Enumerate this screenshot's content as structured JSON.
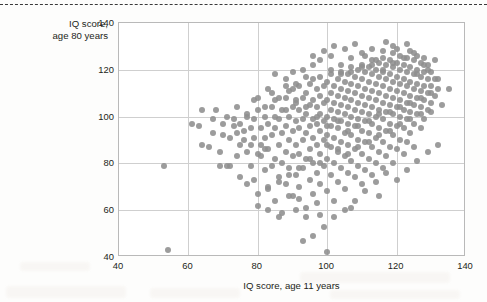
{
  "page": {
    "top_rule": "dashed",
    "background": "#fdfdfc"
  },
  "chart_data": {
    "type": "scatter",
    "title": "",
    "xlabel": "IQ score, age 11 years",
    "ylabel": "IQ score,\nage 80 years",
    "ylabel_line1": "IQ score,",
    "ylabel_line2": "age 80 years",
    "xlim": [
      40,
      140
    ],
    "ylim": [
      40,
      140
    ],
    "xticks": [
      40,
      60,
      80,
      100,
      120,
      140
    ],
    "yticks": [
      40,
      60,
      80,
      100,
      120,
      140
    ],
    "grid": true,
    "legend": null,
    "marker_color": "#8e8e8e",
    "marker_size_px": 6,
    "n_points": 424,
    "points": [
      [
        53,
        79
      ],
      [
        54,
        43
      ],
      [
        63,
        96
      ],
      [
        64,
        88
      ],
      [
        66,
        87
      ],
      [
        67,
        93
      ],
      [
        69,
        85
      ],
      [
        70,
        97
      ],
      [
        71,
        79
      ],
      [
        72,
        79
      ],
      [
        73,
        96
      ],
      [
        74,
        93
      ],
      [
        75,
        97
      ],
      [
        75,
        74
      ],
      [
        76,
        90
      ],
      [
        77,
        101
      ],
      [
        77,
        85
      ],
      [
        78,
        88
      ],
      [
        78,
        95
      ],
      [
        79,
        73
      ],
      [
        79,
        99
      ],
      [
        80,
        62
      ],
      [
        80,
        84
      ],
      [
        80,
        103
      ],
      [
        81,
        88
      ],
      [
        81,
        95
      ],
      [
        82,
        77
      ],
      [
        82,
        91
      ],
      [
        82,
        100
      ],
      [
        83,
        69
      ],
      [
        83,
        86
      ],
      [
        83,
        97
      ],
      [
        84,
        79
      ],
      [
        84,
        92
      ],
      [
        84,
        104
      ],
      [
        85,
        64
      ],
      [
        85,
        82
      ],
      [
        85,
        95
      ],
      [
        85,
        107
      ],
      [
        86,
        74
      ],
      [
        86,
        88
      ],
      [
        86,
        99
      ],
      [
        87,
        80
      ],
      [
        87,
        93
      ],
      [
        87,
        103
      ],
      [
        88,
        71
      ],
      [
        88,
        85
      ],
      [
        88,
        96
      ],
      [
        88,
        108
      ],
      [
        89,
        78
      ],
      [
        89,
        90
      ],
      [
        89,
        100
      ],
      [
        89,
        111
      ],
      [
        90,
        66
      ],
      [
        90,
        83
      ],
      [
        90,
        94
      ],
      [
        90,
        104
      ],
      [
        90,
        112
      ],
      [
        91,
        75
      ],
      [
        91,
        88
      ],
      [
        91,
        98
      ],
      [
        91,
        107
      ],
      [
        92,
        70
      ],
      [
        92,
        84
      ],
      [
        92,
        95
      ],
      [
        92,
        103
      ],
      [
        92,
        113
      ],
      [
        93,
        78
      ],
      [
        93,
        90
      ],
      [
        93,
        99
      ],
      [
        93,
        108
      ],
      [
        94,
        61
      ],
      [
        94,
        82
      ],
      [
        94,
        93
      ],
      [
        94,
        101
      ],
      [
        94,
        110
      ],
      [
        95,
        73
      ],
      [
        95,
        86
      ],
      [
        95,
        96
      ],
      [
        95,
        105
      ],
      [
        95,
        114
      ],
      [
        96,
        67
      ],
      [
        96,
        80
      ],
      [
        96,
        91
      ],
      [
        96,
        99
      ],
      [
        96,
        107
      ],
      [
        96,
        116
      ],
      [
        97,
        76
      ],
      [
        97,
        88
      ],
      [
        97,
        97
      ],
      [
        97,
        104
      ],
      [
        97,
        112
      ],
      [
        98,
        58
      ],
      [
        98,
        71
      ],
      [
        98,
        84
      ],
      [
        98,
        94
      ],
      [
        98,
        101
      ],
      [
        98,
        109
      ],
      [
        98,
        117
      ],
      [
        99,
        79
      ],
      [
        99,
        90
      ],
      [
        99,
        98
      ],
      [
        99,
        106
      ],
      [
        99,
        113
      ],
      [
        100,
        42
      ],
      [
        100,
        68
      ],
      [
        100,
        82
      ],
      [
        100,
        92
      ],
      [
        100,
        100
      ],
      [
        100,
        107
      ],
      [
        100,
        115
      ],
      [
        101,
        75
      ],
      [
        101,
        87
      ],
      [
        101,
        96
      ],
      [
        101,
        103
      ],
      [
        101,
        110
      ],
      [
        101,
        118
      ],
      [
        102,
        64
      ],
      [
        102,
        80
      ],
      [
        102,
        91
      ],
      [
        102,
        99
      ],
      [
        102,
        106
      ],
      [
        102,
        113
      ],
      [
        103,
        72
      ],
      [
        103,
        85
      ],
      [
        103,
        95
      ],
      [
        103,
        102
      ],
      [
        103,
        109
      ],
      [
        103,
        116
      ],
      [
        104,
        78
      ],
      [
        104,
        89
      ],
      [
        104,
        98
      ],
      [
        104,
        105
      ],
      [
        104,
        112
      ],
      [
        104,
        119
      ],
      [
        105,
        69
      ],
      [
        105,
        83
      ],
      [
        105,
        93
      ],
      [
        105,
        101
      ],
      [
        105,
        108
      ],
      [
        105,
        115
      ],
      [
        106,
        76
      ],
      [
        106,
        88
      ],
      [
        106,
        97
      ],
      [
        106,
        104
      ],
      [
        106,
        111
      ],
      [
        106,
        118
      ],
      [
        107,
        61
      ],
      [
        107,
        81
      ],
      [
        107,
        92
      ],
      [
        107,
        100
      ],
      [
        107,
        107
      ],
      [
        107,
        114
      ],
      [
        107,
        121
      ],
      [
        108,
        74
      ],
      [
        108,
        86
      ],
      [
        108,
        96
      ],
      [
        108,
        103
      ],
      [
        108,
        110
      ],
      [
        108,
        117
      ],
      [
        109,
        79
      ],
      [
        109,
        90
      ],
      [
        109,
        99
      ],
      [
        109,
        106
      ],
      [
        109,
        113
      ],
      [
        109,
        120
      ],
      [
        110,
        71
      ],
      [
        110,
        84
      ],
      [
        110,
        94
      ],
      [
        110,
        102
      ],
      [
        110,
        109
      ],
      [
        110,
        116
      ],
      [
        110,
        122
      ],
      [
        111,
        77
      ],
      [
        111,
        89
      ],
      [
        111,
        98
      ],
      [
        111,
        105
      ],
      [
        111,
        112
      ],
      [
        111,
        119
      ],
      [
        112,
        82
      ],
      [
        112,
        93
      ],
      [
        112,
        101
      ],
      [
        112,
        108
      ],
      [
        112,
        115
      ],
      [
        112,
        121
      ],
      [
        113,
        75
      ],
      [
        113,
        87
      ],
      [
        113,
        97
      ],
      [
        113,
        104
      ],
      [
        113,
        111
      ],
      [
        113,
        118
      ],
      [
        113,
        124
      ],
      [
        114,
        80
      ],
      [
        114,
        91
      ],
      [
        114,
        100
      ],
      [
        114,
        107
      ],
      [
        114,
        114
      ],
      [
        114,
        120
      ],
      [
        115,
        66
      ],
      [
        115,
        85
      ],
      [
        115,
        95
      ],
      [
        115,
        103
      ],
      [
        115,
        110
      ],
      [
        115,
        117
      ],
      [
        115,
        123
      ],
      [
        116,
        78
      ],
      [
        116,
        89
      ],
      [
        116,
        99
      ],
      [
        116,
        106
      ],
      [
        116,
        113
      ],
      [
        116,
        119
      ],
      [
        116,
        125
      ],
      [
        117,
        83
      ],
      [
        117,
        94
      ],
      [
        117,
        102
      ],
      [
        117,
        109
      ],
      [
        117,
        116
      ],
      [
        117,
        122
      ],
      [
        118,
        87
      ],
      [
        118,
        97
      ],
      [
        118,
        105
      ],
      [
        118,
        112
      ],
      [
        118,
        118
      ],
      [
        118,
        124
      ],
      [
        119,
        80
      ],
      [
        119,
        92
      ],
      [
        119,
        101
      ],
      [
        119,
        108
      ],
      [
        119,
        115
      ],
      [
        119,
        121
      ],
      [
        119,
        127
      ],
      [
        120,
        86
      ],
      [
        120,
        96
      ],
      [
        120,
        104
      ],
      [
        120,
        111
      ],
      [
        120,
        117
      ],
      [
        120,
        123
      ],
      [
        121,
        90
      ],
      [
        121,
        100
      ],
      [
        121,
        107
      ],
      [
        121,
        114
      ],
      [
        121,
        120
      ],
      [
        121,
        126
      ],
      [
        122,
        84
      ],
      [
        122,
        95
      ],
      [
        122,
        103
      ],
      [
        122,
        110
      ],
      [
        122,
        116
      ],
      [
        122,
        122
      ],
      [
        123,
        89
      ],
      [
        123,
        99
      ],
      [
        123,
        106
      ],
      [
        123,
        113
      ],
      [
        123,
        119
      ],
      [
        123,
        125
      ],
      [
        124,
        93
      ],
      [
        124,
        102
      ],
      [
        124,
        109
      ],
      [
        124,
        115
      ],
      [
        124,
        121
      ],
      [
        124,
        128
      ],
      [
        125,
        87
      ],
      [
        125,
        97
      ],
      [
        125,
        105
      ],
      [
        125,
        112
      ],
      [
        125,
        118
      ],
      [
        125,
        124
      ],
      [
        126,
        101
      ],
      [
        126,
        108
      ],
      [
        126,
        114
      ],
      [
        126,
        120
      ],
      [
        126,
        126
      ],
      [
        127,
        95
      ],
      [
        127,
        104
      ],
      [
        127,
        111
      ],
      [
        127,
        117
      ],
      [
        127,
        123
      ],
      [
        128,
        99
      ],
      [
        128,
        107
      ],
      [
        128,
        113
      ],
      [
        128,
        119
      ],
      [
        128,
        125
      ],
      [
        129,
        103
      ],
      [
        129,
        110
      ],
      [
        129,
        116
      ],
      [
        129,
        122
      ],
      [
        130,
        106
      ],
      [
        130,
        113
      ],
      [
        130,
        119
      ],
      [
        131,
        109
      ],
      [
        131,
        116
      ],
      [
        132,
        112
      ],
      [
        86,
        108
      ],
      [
        90,
        119
      ],
      [
        93,
        120
      ],
      [
        96,
        122
      ],
      [
        88,
        113
      ],
      [
        84,
        110
      ],
      [
        87,
        59
      ],
      [
        91,
        60
      ],
      [
        94,
        57
      ],
      [
        97,
        63
      ],
      [
        89,
        66
      ],
      [
        92,
        65
      ],
      [
        83,
        60
      ],
      [
        86,
        57
      ],
      [
        78,
        79
      ],
      [
        81,
        83
      ],
      [
        75,
        88
      ],
      [
        72,
        91
      ],
      [
        69,
        79
      ],
      [
        74,
        83
      ],
      [
        79,
        91
      ],
      [
        82,
        86
      ],
      [
        85,
        100
      ],
      [
        88,
        103
      ],
      [
        91,
        106
      ],
      [
        94,
        104
      ],
      [
        97,
        100
      ],
      [
        100,
        96
      ],
      [
        103,
        98
      ],
      [
        106,
        94
      ],
      [
        109,
        96
      ],
      [
        112,
        98
      ],
      [
        115,
        101
      ],
      [
        118,
        102
      ],
      [
        121,
        104
      ],
      [
        124,
        106
      ],
      [
        127,
        108
      ],
      [
        130,
        110
      ],
      [
        98,
        124
      ],
      [
        101,
        126
      ],
      [
        104,
        122
      ],
      [
        107,
        125
      ],
      [
        110,
        127
      ],
      [
        113,
        129
      ],
      [
        116,
        128
      ],
      [
        119,
        130
      ],
      [
        105,
        60
      ],
      [
        108,
        64
      ],
      [
        111,
        68
      ],
      [
        102,
        57
      ],
      [
        99,
        53
      ],
      [
        96,
        49
      ],
      [
        93,
        47
      ],
      [
        114,
        72
      ],
      [
        117,
        76
      ],
      [
        120,
        73
      ],
      [
        123,
        77
      ],
      [
        126,
        81
      ],
      [
        129,
        85
      ],
      [
        132,
        88
      ],
      [
        80,
        108
      ],
      [
        83,
        112
      ],
      [
        77,
        100
      ],
      [
        74,
        104
      ],
      [
        71,
        100
      ],
      [
        68,
        103
      ],
      [
        100,
        88
      ],
      [
        103,
        86
      ],
      [
        106,
        84
      ],
      [
        109,
        87
      ],
      [
        112,
        89
      ],
      [
        115,
        92
      ],
      [
        118,
        94
      ],
      [
        121,
        97
      ],
      [
        124,
        99
      ],
      [
        127,
        101
      ],
      [
        95,
        82
      ],
      [
        98,
        80
      ],
      [
        92,
        78
      ],
      [
        89,
        75
      ],
      [
        86,
        72
      ],
      [
        83,
        70
      ],
      [
        80,
        67
      ],
      [
        77,
        71
      ],
      [
        101,
        120
      ],
      [
        104,
        118
      ],
      [
        107,
        119
      ],
      [
        110,
        121
      ],
      [
        113,
        122
      ],
      [
        116,
        120
      ],
      [
        119,
        123
      ],
      [
        122,
        125
      ],
      [
        125,
        127
      ],
      [
        128,
        122
      ],
      [
        131,
        124
      ],
      [
        94,
        117
      ],
      [
        91,
        114
      ],
      [
        88,
        116
      ],
      [
        85,
        118
      ],
      [
        82,
        104
      ],
      [
        79,
        107
      ],
      [
        76,
        94
      ],
      [
        73,
        99
      ],
      [
        70,
        92
      ],
      [
        67,
        99
      ],
      [
        64,
        103
      ],
      [
        61,
        97
      ],
      [
        105,
        129
      ],
      [
        108,
        131
      ],
      [
        111,
        126
      ],
      [
        99,
        128
      ],
      [
        96,
        126
      ],
      [
        102,
        130
      ],
      [
        114,
        124
      ],
      [
        117,
        132
      ],
      [
        120,
        129
      ],
      [
        123,
        131
      ],
      [
        126,
        118
      ],
      [
        129,
        120
      ],
      [
        132,
        116
      ],
      [
        135,
        112
      ],
      [
        133,
        105
      ],
      [
        130,
        102
      ]
    ]
  }
}
